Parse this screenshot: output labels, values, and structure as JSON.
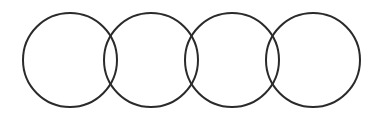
{
  "diagram": {
    "stroke_color": "#2a2a2a",
    "background": "#ffffff",
    "stroke_width": 2,
    "circles": [
      {
        "cx": 70,
        "cy": 60,
        "r": 47
      },
      {
        "cx": 151,
        "cy": 60,
        "r": 47
      },
      {
        "cx": 232,
        "cy": 60,
        "r": 47
      },
      {
        "cx": 313,
        "cy": 60,
        "r": 47
      }
    ]
  }
}
